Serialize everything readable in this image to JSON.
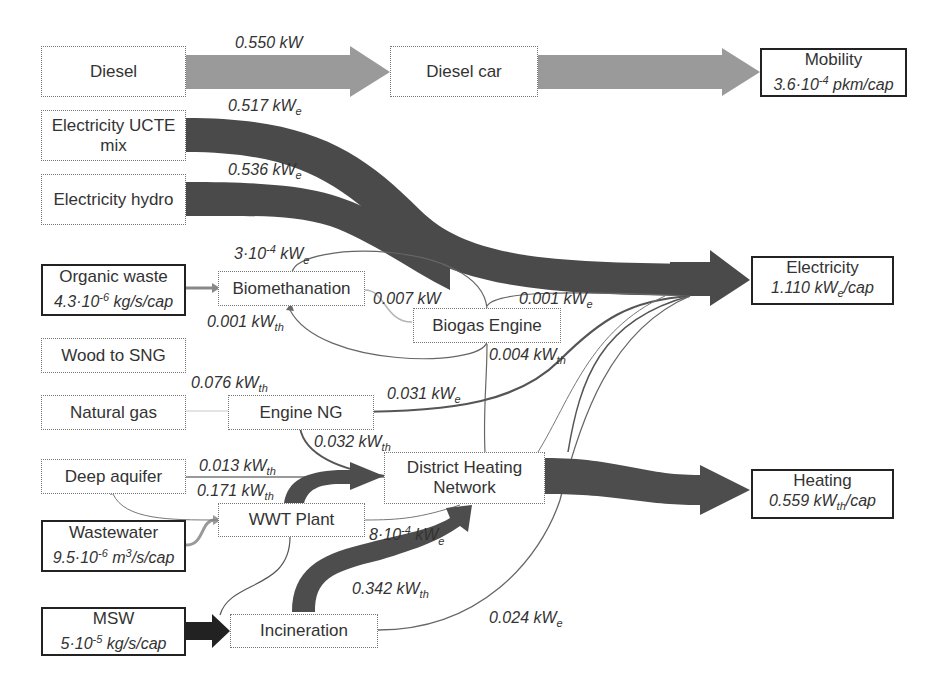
{
  "colors": {
    "diesel_flow": "#9a9a9a",
    "electricity_flow": "#4a4a4a",
    "heat_flow": "#4d4d4d",
    "thin_line": "#666666",
    "light_line": "#b0b0b0"
  },
  "nodes": {
    "diesel": {
      "label": "Diesel"
    },
    "diesel_car": {
      "label": "Diesel car"
    },
    "mobility": {
      "label": "Mobility",
      "value": "3.6·10",
      "exp": "-4",
      "unit": " pkm/cap"
    },
    "elec_ucte": {
      "label": "Electricity UCTE",
      "label2": "mix"
    },
    "elec_hydro": {
      "label": "Electricity hydro"
    },
    "organic_waste": {
      "label": "Organic waste",
      "value": "4.3·10",
      "exp": "-6",
      "unit": " kg/s/cap"
    },
    "biomethanation": {
      "label": "Biomethanation"
    },
    "biogas_engine": {
      "label": "Biogas Engine"
    },
    "electricity": {
      "label": "Electricity",
      "value": "1.110 kW",
      "sub": "e",
      "unit": "/cap"
    },
    "wood_sng": {
      "label": "Wood to SNG"
    },
    "natural_gas": {
      "label": "Natural gas"
    },
    "engine_ng": {
      "label": "Engine NG"
    },
    "deep_aquifer": {
      "label": "Deep aquifer"
    },
    "district_heating": {
      "label": "District Heating",
      "label2": "Network"
    },
    "heating": {
      "label": "Heating",
      "value": "0.559 kW",
      "sub": "th",
      "unit": "/cap"
    },
    "wastewater": {
      "label": "Wastewater",
      "value": "9.5·10",
      "exp": "-6",
      "unit": " m",
      "exp2": "3",
      "unit2": "/s/cap"
    },
    "wwt_plant": {
      "label": "WWT Plant"
    },
    "msw": {
      "label": "MSW",
      "value": "5·10",
      "exp": "-5",
      "unit": " kg/s/cap"
    },
    "incineration": {
      "label": "Incineration"
    }
  },
  "flow_labels": {
    "diesel_flow": {
      "value": "0.550 kW",
      "sub": ""
    },
    "ucte_flow": {
      "value": "0.517 kW",
      "sub": "e"
    },
    "hydro_flow": {
      "value": "0.536 kW",
      "sub": "e"
    },
    "biomethanation_elec": {
      "value": "3·10",
      "exp": "-4",
      "unit": " kW",
      "sub": "e"
    },
    "biogas_flow": {
      "value": "0.007 kW",
      "sub": ""
    },
    "biomethanation_heat": {
      "value": "0.001 kW",
      "sub": "th"
    },
    "biogas_elec": {
      "value": "0.001 kW",
      "sub": "e"
    },
    "biogas_heat": {
      "value": "0.004 kW",
      "sub": "th"
    },
    "ng_flow": {
      "value": "0.076 kW",
      "sub": "th"
    },
    "engine_ng_elec": {
      "value": "0.031 kW",
      "sub": "e"
    },
    "engine_ng_heat": {
      "value": "0.032 kW",
      "sub": "th"
    },
    "aquifer_heat": {
      "value": "0.013 kW",
      "sub": "th"
    },
    "wwt_heat": {
      "value": "0.171 kW",
      "sub": "th"
    },
    "wwt_elec": {
      "value": "8·10",
      "exp": "-4",
      "unit": " kW",
      "sub": "e"
    },
    "incineration_heat": {
      "value": "0.342 kW",
      "sub": "th"
    },
    "incineration_elec": {
      "value": "0.024 kW",
      "sub": "e"
    }
  }
}
